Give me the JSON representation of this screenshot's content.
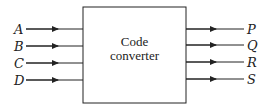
{
  "diagram": {
    "block": {
      "line1": "Code",
      "line2": "converter"
    },
    "inputs": [
      {
        "label": "A",
        "y": 29
      },
      {
        "label": "B",
        "y": 46
      },
      {
        "label": "C",
        "y": 63
      },
      {
        "label": "D",
        "y": 80
      }
    ],
    "outputs": [
      {
        "label": "P",
        "y": 29
      },
      {
        "label": "Q",
        "y": 45
      },
      {
        "label": "R",
        "y": 62
      },
      {
        "label": "S",
        "y": 79
      }
    ],
    "colors": {
      "line": "#222222",
      "background": "#ffffff"
    }
  }
}
